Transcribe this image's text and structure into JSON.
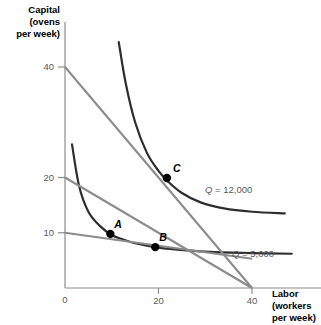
{
  "chart_data": {
    "type": "line",
    "title": "",
    "xlabel": "Labor (workers per week)",
    "ylabel": "Capital (ovens per week)",
    "xlim": [
      0,
      47
    ],
    "ylim": [
      0,
      48
    ],
    "grid": false,
    "legend_position": "inline-right",
    "x_ticks": [
      {
        "value": 0,
        "label": "0"
      },
      {
        "value": 20,
        "label": "20"
      },
      {
        "value": 40,
        "label": "40"
      }
    ],
    "y_ticks": [
      {
        "value": 10,
        "label": "10"
      },
      {
        "value": 20,
        "label": "20"
      },
      {
        "value": 40,
        "label": "40"
      }
    ],
    "series": [
      {
        "name": "Q = 5,000",
        "kind": "isoquant",
        "color": "#2d2d2d",
        "label": "Q = 5,000",
        "label_math_italic": "Q",
        "label_rest": " = 5,000",
        "points": [
          [
            1.5,
            26.0
          ],
          [
            3.0,
            18.5
          ],
          [
            5.0,
            13.8
          ],
          [
            7.5,
            11.2
          ],
          [
            10.0,
            9.6
          ],
          [
            12.0,
            8.9
          ],
          [
            15.0,
            8.1
          ],
          [
            20.0,
            7.3
          ],
          [
            26.0,
            6.8
          ],
          [
            32.0,
            6.5
          ],
          [
            40.0,
            6.3
          ],
          [
            48.5,
            6.2
          ]
        ]
      },
      {
        "name": "Q = 12,000",
        "kind": "isoquant",
        "color": "#2d2d2d",
        "label": "Q = 12,000",
        "label_math_italic": "Q",
        "label_rest": " = 12,000",
        "points": [
          [
            11.5,
            44.5
          ],
          [
            13.0,
            37.0
          ],
          [
            15.0,
            30.0
          ],
          [
            17.5,
            24.5
          ],
          [
            20.0,
            21.2
          ],
          [
            22.0,
            19.3
          ],
          [
            25.0,
            17.2
          ],
          [
            29.0,
            15.5
          ],
          [
            34.0,
            14.4
          ],
          [
            40.0,
            13.8
          ],
          [
            47.0,
            13.5
          ]
        ]
      },
      {
        "name": "isocost-high",
        "kind": "isocost",
        "color": "#8c8c8e",
        "intercept_capital": 40,
        "intercept_labor": 40,
        "points": [
          [
            0,
            40
          ],
          [
            40,
            0
          ]
        ]
      },
      {
        "name": "isocost-low",
        "kind": "isocost",
        "color": "#8c8c8e",
        "intercept_capital": 20,
        "intercept_labor": 40,
        "points": [
          [
            0,
            20
          ],
          [
            40,
            0
          ]
        ]
      },
      {
        "name": "budget-flat",
        "kind": "isocost",
        "color": "#8c8c8e",
        "points": [
          [
            0,
            10
          ],
          [
            40,
            5.3
          ]
        ]
      }
    ],
    "annotations": [
      {
        "label": "A",
        "x": 9.7,
        "y": 9.8,
        "marker": "filled-circle"
      },
      {
        "label": "B",
        "x": 19.3,
        "y": 7.4,
        "marker": "filled-circle"
      },
      {
        "label": "C",
        "x": 21.8,
        "y": 19.9,
        "marker": "filled-circle"
      }
    ]
  },
  "axes": {
    "y_title": "Capital\n(ovens\nper week)",
    "x_title": "Labor\n(workers\nper week)"
  }
}
